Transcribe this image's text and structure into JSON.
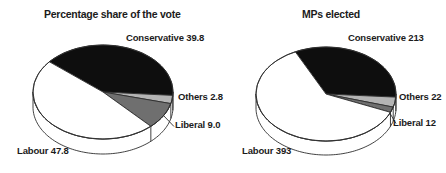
{
  "figure": {
    "background": "#ffffff",
    "stroke_color": "#2e2e2e",
    "text_color": "#1b1b1b"
  },
  "chart_data": [
    {
      "type": "pie",
      "title": "Percentage share of the vote",
      "unit": "percent",
      "legend_position": "none",
      "slices": [
        {
          "name": "Conservative",
          "value": 39.8,
          "label": "Conservative 39.8",
          "color": "#0e0e0e"
        },
        {
          "name": "Others",
          "value": 2.8,
          "label": "Others 2.8",
          "color": "#b4b4b4"
        },
        {
          "name": "Liberal",
          "value": 9.0,
          "label": "Liberal 9.0",
          "color": "#6f6f6f"
        },
        {
          "name": "Labour",
          "value": 47.8,
          "label": "Labour 47.8",
          "color": "#ffffff"
        }
      ],
      "layout": {
        "cx": 103,
        "cy": 92,
        "rx": 70,
        "ry": 47,
        "depth": 15,
        "start_deg": 140,
        "label_pos": [
          {
            "x": 126,
            "y": 32
          },
          {
            "x": 178,
            "y": 91
          },
          {
            "x": 175,
            "y": 119
          },
          {
            "x": 17,
            "y": 145
          }
        ],
        "leader": {
          "x1": 163.5,
          "y1": 115.5,
          "x2": 174,
          "y2": 126.5
        }
      }
    },
    {
      "type": "pie",
      "title": "MPs elected",
      "unit": "seats",
      "legend_position": "none",
      "slices": [
        {
          "name": "Conservative",
          "value": 213,
          "label": "Conservative 213",
          "color": "#0e0e0e"
        },
        {
          "name": "Others",
          "value": 22,
          "label": "Others 22",
          "color": "#b4b4b4"
        },
        {
          "name": "Liberal",
          "value": 12,
          "label": "Liberal 12",
          "color": "#6f6f6f"
        },
        {
          "name": "Labour",
          "value": 393,
          "label": "Labour 393",
          "color": "#ffffff"
        }
      ],
      "layout": {
        "cx": 326,
        "cy": 94,
        "rx": 70,
        "ry": 47,
        "depth": 14,
        "start_deg": 116,
        "label_pos": [
          {
            "x": 348,
            "y": 32
          },
          {
            "x": 399,
            "y": 91
          },
          {
            "x": 393,
            "y": 117
          },
          {
            "x": 242,
            "y": 145
          }
        ],
        "leader": {
          "x1": 389.5,
          "y1": 112.5,
          "x2": 396,
          "y2": 123.5
        }
      }
    }
  ]
}
